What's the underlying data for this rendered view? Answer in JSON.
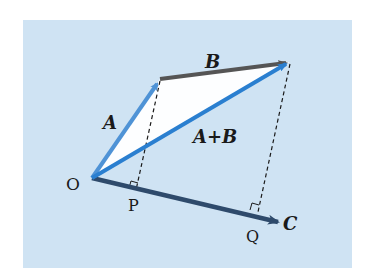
{
  "figure": {
    "background_color": "#cfe3f3",
    "triangle_fill": "#ffffff",
    "points": {
      "O": {
        "label": "O",
        "x": 92,
        "y": 178
      },
      "A_tip": {
        "x": 160,
        "y": 79
      },
      "AB_tip": {
        "x": 290,
        "y": 62
      },
      "P": {
        "label": "P",
        "x": 136,
        "y": 190
      },
      "Q": {
        "label": "Q",
        "x": 259,
        "y": 212
      },
      "C_tip": {
        "x": 280,
        "y": 223
      }
    },
    "vectors": [
      {
        "name": "A",
        "label": "A",
        "color": "#4f93d6"
      },
      {
        "name": "B",
        "label": "B",
        "color": "#555555"
      },
      {
        "name": "A+B",
        "label": "A+B",
        "color": "#2a7fd0"
      },
      {
        "name": "C",
        "label": "C",
        "color": "#2e4a6b"
      }
    ],
    "labels": {
      "O": "O",
      "P": "P",
      "Q": "Q",
      "A": "A",
      "B": "B",
      "A_plus_B": "A+B",
      "C": "C"
    },
    "projection_lines": [
      {
        "from": "A_tip",
        "to": "P",
        "style": "dashed",
        "right_angle_marker": true
      },
      {
        "from": "AB_tip",
        "to": "Q",
        "style": "dashed",
        "right_angle_marker": true
      }
    ]
  }
}
